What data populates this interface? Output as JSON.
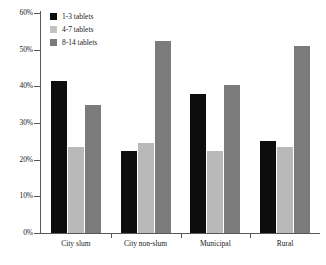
{
  "chart_data": {
    "type": "bar",
    "title": "",
    "subtitle": "",
    "xlabel": "",
    "ylabel": "",
    "categories": [
      "City slum",
      "City non-slum",
      "Municipal",
      "Rural"
    ],
    "series": [
      {
        "name": "1-3 tablets",
        "values": [
          41.5,
          22.5,
          38.0,
          25.0
        ],
        "color": "#0d0d0d"
      },
      {
        "name": "4-7 tablets",
        "values": [
          23.5,
          24.5,
          22.5,
          23.5
        ],
        "color": "#b9b9b9"
      },
      {
        "name": "8-14 tablets",
        "values": [
          35.0,
          52.5,
          40.5,
          51.0
        ],
        "color": "#7b7b7b"
      }
    ],
    "ylim": [
      0,
      60
    ],
    "yticks": [
      0,
      10,
      20,
      30,
      40,
      50,
      60
    ],
    "ytick_labels": [
      "0%",
      "10%",
      "20%",
      "30%",
      "40%",
      "50%",
      "60%"
    ],
    "grid": false,
    "legend_position": "upper left",
    "axis_color": "#585858"
  },
  "legend": {
    "items": [
      {
        "label": "1-3 tablets"
      },
      {
        "label": "4-7 tablets"
      },
      {
        "label": "8-14 tablets"
      }
    ]
  }
}
